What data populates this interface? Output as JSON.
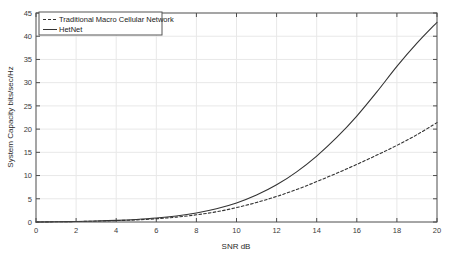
{
  "chart_data": {
    "type": "line",
    "title": "",
    "xlabel": "SNR dB",
    "ylabel": "System Capacity bits/sec/Hz",
    "xlim": [
      0,
      20
    ],
    "ylim": [
      0,
      45
    ],
    "xticks": [
      0,
      2,
      4,
      6,
      8,
      10,
      12,
      14,
      16,
      18,
      20
    ],
    "yticks": [
      0,
      5,
      10,
      15,
      20,
      25,
      30,
      35,
      40,
      45
    ],
    "grid": true,
    "legend_position": "top-left",
    "x": [
      0,
      1,
      2,
      3,
      4,
      5,
      6,
      7,
      8,
      9,
      10,
      11,
      12,
      13,
      14,
      15,
      16,
      17,
      18,
      19,
      20
    ],
    "series": [
      {
        "name": "Traditional Macro Cellular Network",
        "style": "dashed",
        "color": "#333333",
        "values": [
          0.0,
          0.05,
          0.1,
          0.18,
          0.3,
          0.45,
          0.7,
          1.05,
          1.55,
          2.2,
          3.1,
          4.2,
          5.5,
          7.0,
          8.7,
          10.5,
          12.4,
          14.4,
          16.5,
          18.8,
          21.4
        ]
      },
      {
        "name": "HetNet",
        "style": "solid",
        "color": "#333333",
        "values": [
          0.0,
          0.05,
          0.12,
          0.22,
          0.35,
          0.55,
          0.85,
          1.3,
          1.95,
          2.85,
          4.1,
          5.8,
          8.0,
          10.8,
          14.2,
          18.2,
          22.8,
          28.0,
          33.5,
          38.5,
          43.0
        ]
      }
    ]
  },
  "axes": {
    "x_title": "SNR dB",
    "y_title": "System Capacity bits/sec/Hz",
    "x_tick_labels": [
      "0",
      "2",
      "4",
      "6",
      "8",
      "10",
      "12",
      "14",
      "16",
      "18",
      "20"
    ],
    "y_tick_labels": [
      "0",
      "5",
      "10",
      "15",
      "20",
      "25",
      "30",
      "35",
      "40",
      "45"
    ]
  },
  "legend": {
    "entries": [
      {
        "label": "Traditional Macro Cellular Network",
        "style": "dashed"
      },
      {
        "label": "HetNet",
        "style": "solid"
      }
    ]
  },
  "colors": {
    "background": "#ffffff",
    "axis": "#4d4d4d",
    "grid": "#e8e8e8",
    "line": "#333333",
    "text": "#2a2a2a"
  }
}
